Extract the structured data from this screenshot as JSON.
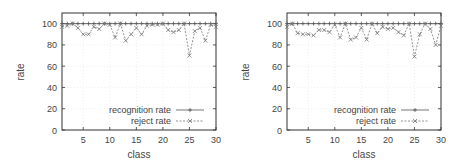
{
  "chart_data": [
    {
      "type": "line",
      "title": "",
      "xlabel": "class",
      "ylabel": "rate",
      "xlim": [
        1,
        30
      ],
      "ylim": [
        0,
        110
      ],
      "xticks": [
        5,
        10,
        15,
        20,
        25,
        30
      ],
      "yticks": [
        0,
        20,
        40,
        60,
        80,
        100
      ],
      "grid": true,
      "legend_position": "lower right",
      "x": [
        1,
        2,
        3,
        4,
        5,
        6,
        7,
        8,
        9,
        10,
        11,
        12,
        13,
        14,
        15,
        16,
        17,
        18,
        19,
        20,
        21,
        22,
        23,
        24,
        25,
        26,
        27,
        28,
        29,
        30
      ],
      "series": [
        {
          "name": "recognition rate",
          "marker": "+",
          "linestyle": "solid",
          "values": [
            100,
            100,
            100,
            100,
            100,
            100,
            100,
            100,
            100,
            100,
            100,
            100,
            100,
            100,
            100,
            100,
            100,
            100,
            100,
            100,
            100,
            100,
            100,
            100,
            100,
            100,
            100,
            100,
            100,
            100
          ]
        },
        {
          "name": "reject rate",
          "marker": "x",
          "linestyle": "dashed",
          "values": [
            97,
            98,
            100,
            96,
            90,
            90,
            97,
            95,
            100,
            99,
            87,
            100,
            84,
            90,
            96,
            90,
            98,
            99,
            99,
            100,
            94,
            92,
            94,
            100,
            70,
            93,
            96,
            84,
            99,
            97
          ]
        }
      ]
    },
    {
      "type": "line",
      "title": "",
      "xlabel": "class",
      "ylabel": "rate",
      "xlim": [
        1,
        30
      ],
      "ylim": [
        0,
        110
      ],
      "xticks": [
        5,
        10,
        15,
        20,
        25,
        30
      ],
      "yticks": [
        0,
        20,
        40,
        60,
        80,
        100
      ],
      "grid": true,
      "legend_position": "lower right",
      "x": [
        1,
        2,
        3,
        4,
        5,
        6,
        7,
        8,
        9,
        10,
        11,
        12,
        13,
        14,
        15,
        16,
        17,
        18,
        19,
        20,
        21,
        22,
        23,
        24,
        25,
        26,
        27,
        28,
        29,
        30
      ],
      "series": [
        {
          "name": "recognition rate",
          "marker": "+",
          "linestyle": "solid",
          "values": [
            100,
            100,
            100,
            100,
            100,
            100,
            100,
            100,
            100,
            100,
            100,
            100,
            100,
            100,
            100,
            100,
            100,
            100,
            100,
            100,
            100,
            100,
            100,
            100,
            100,
            100,
            100,
            100,
            100,
            100
          ]
        },
        {
          "name": "reject rate",
          "marker": "x",
          "linestyle": "dashed",
          "values": [
            97,
            100,
            91,
            90,
            90,
            89,
            94,
            94,
            92,
            99,
            87,
            100,
            85,
            87,
            96,
            85,
            100,
            91,
            97,
            95,
            96,
            92,
            89,
            100,
            69,
            90,
            100,
            95,
            80,
            98
          ]
        }
      ]
    }
  ],
  "charts": [
    {
      "ylabel": "rate",
      "xlabel": "class",
      "legend": [
        "recognition rate",
        "reject rate"
      ],
      "yticklabels": [
        "0",
        "20",
        "40",
        "60",
        "80",
        "100"
      ],
      "xticklabels": [
        "5",
        "10",
        "15",
        "20",
        "25",
        "30"
      ]
    },
    {
      "ylabel": "rate",
      "xlabel": "class",
      "legend": [
        "recognition rate",
        "reject rate"
      ],
      "yticklabels": [
        "0",
        "20",
        "40",
        "60",
        "80",
        "100"
      ],
      "xticklabels": [
        "5",
        "10",
        "15",
        "20",
        "25",
        "30"
      ]
    }
  ],
  "colors": {
    "axis": "#333333",
    "grid": "#dddddd",
    "recognition_line": "#555555",
    "reject_line": "#777777",
    "text": "#444444"
  }
}
